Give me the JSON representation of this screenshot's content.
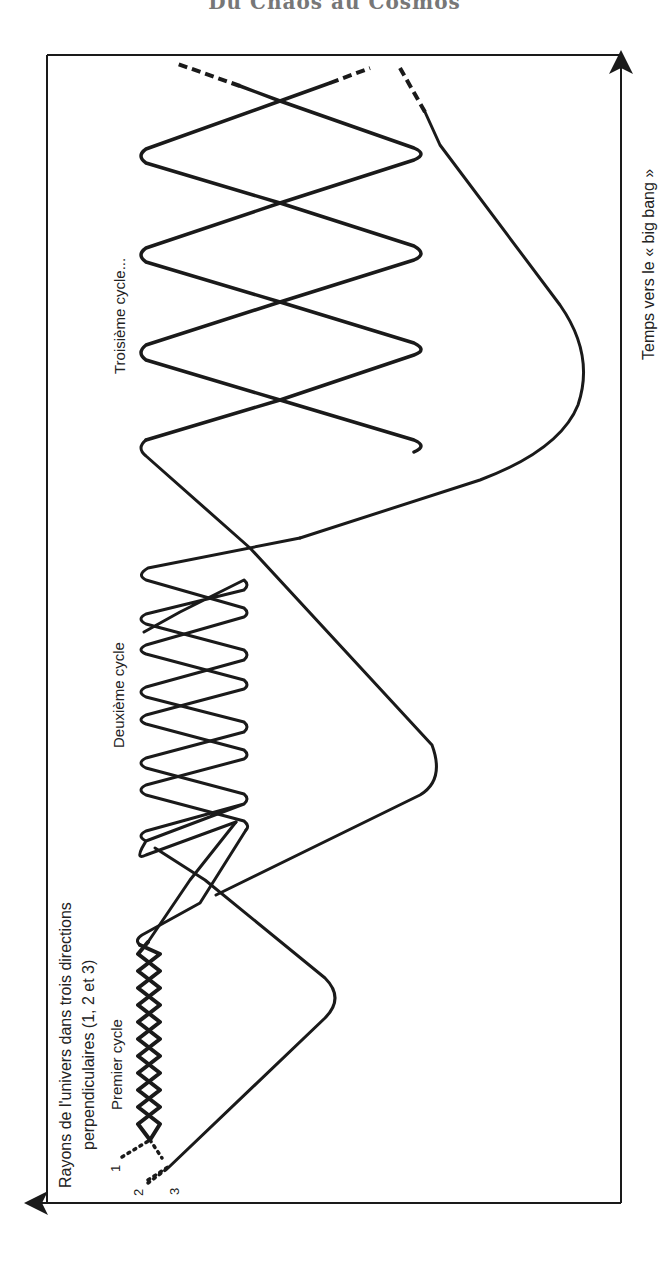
{
  "page": {
    "header_title": "Du Chaos au Cosmos"
  },
  "axes": {
    "time_label": "Temps vers le « big bang »",
    "radius_label_line1": "Rayons de l'univers dans trois directions",
    "radius_label_line2": "perpendiculaires (1, 2 et 3)"
  },
  "cycles": {
    "first": "Premier cycle",
    "second": "Deuxième cycle",
    "third": "Troisième cycle..."
  },
  "curve_labels": [
    "1",
    "2",
    "3"
  ],
  "colors": {
    "ink": "#1a1a1a",
    "background": "#ffffff",
    "title": "#777777"
  },
  "frame": {
    "left": 47,
    "top": 55,
    "right": 621,
    "bottom": 1203
  },
  "curves": [
    {
      "id": "1",
      "dotted_start": "M120,1155 L148,1137",
      "path": "M148,1137 L160,1122 L138,1105 L160,1088 L138,1071 L160,1054 L138,1037 L160,1020 L138,1003 L160,986 L138,969 L160,952 L140,944 Q136,940 142,936 L170,918 L228,882 L246,870 Q250,866 246,862 L142,836 Q134,832 142,828 L246,800 Q250,796 246,792 L142,766 Q134,762 142,758 L246,730 Q250,726 246,722 L142,696 Q134,692 142,688 L246,658 Q250,654 246,650 L142,620 Q134,615 142,610 L246,580 Q250,576 246,572 L165,574 L142,572 Q134,566 144,560 L250,530 L420,463 Q428,456 420,450 L146,353 Q138,348 146,343 L420,258 Q428,253 420,248 L146,160 Q138,155 146,150 L280,101 L368,68",
      "dashed_end": "M368,68 L340,78",
      "dashed_tail": "M305,90 L370,66"
    }
  ]
}
